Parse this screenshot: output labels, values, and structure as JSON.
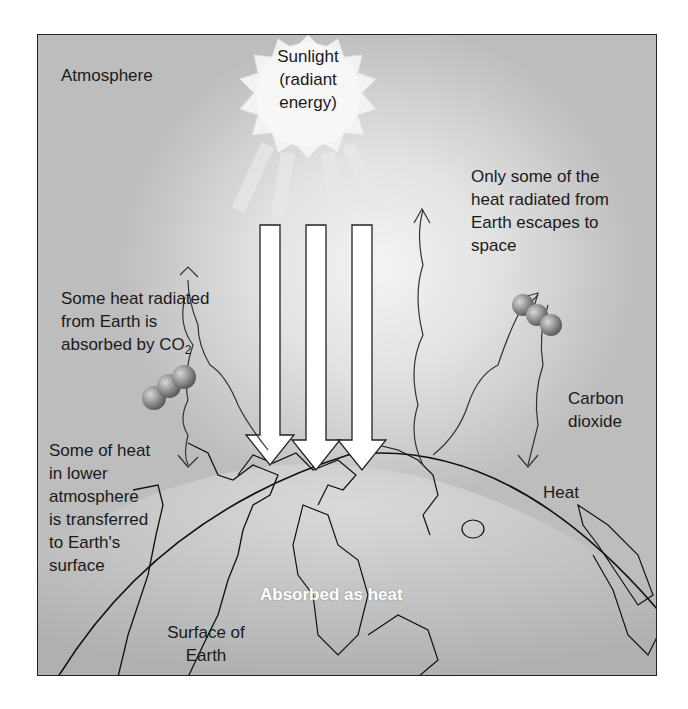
{
  "diagram": {
    "labels": {
      "atmosphere": "Atmosphere",
      "sunlight_line1": "Sunlight",
      "sunlight_line2": "(radiant",
      "sunlight_line3": "energy)",
      "escape_line1": "Only some of the",
      "escape_line2": "heat radiated from",
      "escape_line3": "Earth escapes to",
      "escape_line4": "space",
      "absorbed_line1": "Some heat radiated",
      "absorbed_line2": "from Earth is",
      "absorbed_line3": "absorbed by CO",
      "absorbed_sub": "2",
      "lower_line1": "Some of heat",
      "lower_line2": "in lower",
      "lower_line3": "atmosphere",
      "lower_line4": "is transferred",
      "lower_line5": "to Earth's",
      "lower_line6": "surface",
      "co2_line1": "Carbon",
      "co2_line2": "dioxide",
      "heat": "Heat",
      "absorbed_as_heat": "Absorbed as heat",
      "surface_line1": "Surface of",
      "surface_line2": "Earth"
    },
    "elements": {
      "sun": "sun-icon",
      "sunlight_arrows": 3,
      "co2_molecules": 2,
      "wavy_heat_arrows": 5
    },
    "colors": {
      "background_light": "#f4f4f4",
      "background_dark": "#bdbdbd",
      "earth": "#c8c8c8",
      "lines": "#222222",
      "arrow_fill": "#ffffff"
    }
  }
}
